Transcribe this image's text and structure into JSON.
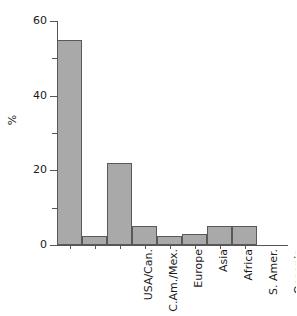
{
  "chart_data": {
    "type": "bar",
    "title": "",
    "xlabel": "",
    "ylabel": "%",
    "categories": [
      "USA/Can.",
      "C.Am./Mex.",
      "Europe",
      "Asia",
      "Africa",
      "S. Amer.",
      "Oceania",
      "Non/Geogr."
    ],
    "values": [
      55,
      2.5,
      22,
      5,
      2.5,
      3,
      5,
      5
    ],
    "ylim": [
      0,
      60
    ],
    "yticks": [
      0,
      20,
      40,
      60
    ],
    "ytick_labels": [
      "0",
      "20",
      "40",
      "60"
    ],
    "yticks_minor": [
      10,
      30,
      50
    ],
    "grid": false,
    "legend": false,
    "bar_fill_color": "#a9a9a9",
    "bar_edge_color": "#595959",
    "axis_color": "#555555",
    "background_color": "#ffffff"
  }
}
